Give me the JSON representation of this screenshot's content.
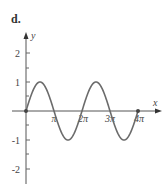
{
  "panel": {
    "label": "d."
  },
  "chart_data": {
    "type": "line",
    "title": "",
    "xlabel": "x",
    "ylabel": "y",
    "function": "y = sin(x)",
    "xlim": [
      0,
      4.5
    ],
    "ylim": [
      -2.5,
      2.5
    ],
    "x_tick_labels": [
      "π",
      "2π",
      "3π",
      "4π"
    ],
    "x_tick_values_in_pi": [
      1,
      2,
      3,
      4
    ],
    "y_tick_labels": [
      "2",
      "1",
      "-1",
      "-2"
    ],
    "y_tick_values": [
      2,
      1,
      -1,
      -2
    ],
    "series": [
      {
        "name": "sin(x)",
        "x_in_pi": [
          0,
          0.5,
          1,
          1.5,
          2,
          2.5,
          3,
          3.5,
          4
        ],
        "values": [
          0,
          1,
          0,
          -1,
          0,
          1,
          0,
          -1,
          0
        ]
      }
    ],
    "points": [
      {
        "x_in_pi": 0,
        "y": 0,
        "marker": "dot"
      },
      {
        "x_in_pi": 4,
        "y": 0,
        "marker": "dot"
      }
    ],
    "grid": false,
    "legend": null,
    "colors": {
      "curve": "#6b6b6b",
      "axis": "#555555"
    }
  }
}
